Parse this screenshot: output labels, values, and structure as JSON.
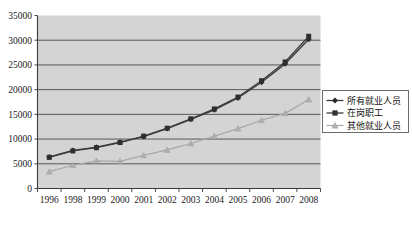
{
  "chart_data": {
    "type": "line",
    "title": "",
    "subtitle": "",
    "xlabel": "",
    "ylabel": "",
    "grid": true,
    "legend_position": "right",
    "categories": [
      "1996",
      "1998",
      "1999",
      "2000",
      "2001",
      "2002",
      "2003",
      "2004",
      "2005",
      "2006",
      "2007",
      "2008"
    ],
    "ylim": [
      0,
      35000
    ],
    "ytick_values": [
      0,
      5000,
      10000,
      15000,
      20000,
      25000,
      30000,
      35000
    ],
    "ytick_labels": [
      "0",
      "5000",
      "10000",
      "15000",
      "20000",
      "25000",
      "30000",
      "35000"
    ],
    "series": [
      {
        "name": "所有就业人员",
        "marker": "diamond",
        "color": "#2b2b2b",
        "values": [
          6400,
          7700,
          8350,
          9400,
          10500,
          12100,
          14000,
          15900,
          18300,
          21500,
          25200,
          30200
        ]
      },
      {
        "name": "在岗职工",
        "marker": "square",
        "color": "#2f2f2f",
        "values": [
          6300,
          7600,
          8250,
          9300,
          10600,
          12200,
          14100,
          16100,
          18500,
          21800,
          25600,
          30800
        ]
      },
      {
        "name": "其他就业人员",
        "marker": "triangle",
        "color": "#b0b0b0",
        "values": [
          3400,
          4700,
          5600,
          5500,
          6700,
          7800,
          9100,
          10600,
          12100,
          13800,
          15200,
          18000
        ]
      }
    ]
  },
  "legend": {
    "entries": [
      {
        "label": "所有就业人员",
        "marker": "diamond"
      },
      {
        "label": "在岗职工",
        "marker": "square"
      },
      {
        "label": "其他就业人员",
        "marker": "triangle"
      }
    ]
  },
  "colors": {
    "plot_background": "#d4d4d4",
    "page_background": "#ffffff",
    "gridline": "#4a4a4a",
    "series_dark": "#2b2b2b",
    "series_light": "#b0b0b0"
  }
}
